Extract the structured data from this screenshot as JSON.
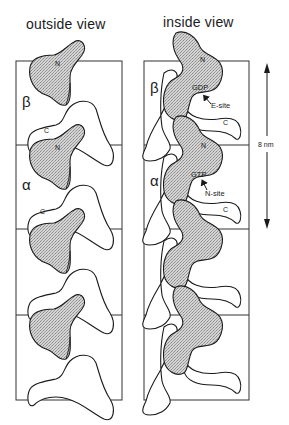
{
  "figure": {
    "panels": [
      {
        "title": "outside view",
        "subunits": [
          {
            "label": "β",
            "n_label": "N",
            "c_label": "C"
          },
          {
            "label": "α",
            "n_label": "N",
            "c_label": "C"
          },
          {
            "label": "",
            "n_label": "",
            "c_label": ""
          },
          {
            "label": "",
            "n_label": "",
            "c_label": ""
          }
        ]
      },
      {
        "title": "inside view",
        "subunits": [
          {
            "label": "β",
            "n_label": "N",
            "nucleotide": "GDP",
            "site": "E-site",
            "c_label": "C"
          },
          {
            "label": "α",
            "n_label": "N",
            "nucleotide": "GTP",
            "site": "N-site",
            "c_label": "C"
          },
          {
            "label": "",
            "n_label": "",
            "nucleotide": "",
            "site": "",
            "c_label": ""
          },
          {
            "label": "",
            "n_label": "",
            "nucleotide": "",
            "site": "",
            "c_label": ""
          }
        ]
      }
    ],
    "scale_bar": {
      "label": "8 nm",
      "direction": "vertical-double-arrow"
    },
    "colors": {
      "stroke": "#1a1a1a",
      "fill_n_domain": "#c8c8c8",
      "fill_body": "#ffffff",
      "box": "#333333"
    }
  }
}
